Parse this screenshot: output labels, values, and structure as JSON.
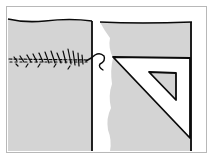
{
  "illustration": {
    "subject": "sewing seam beside a set square",
    "colors": {
      "background": "#ffffff",
      "frame": "#b8b8b8",
      "fabric": "#d4d4d4",
      "ink": "#0a0a0a",
      "tear": "#ffffff"
    },
    "elements": [
      {
        "name": "left-fabric-panel"
      },
      {
        "name": "stitched-seam"
      },
      {
        "name": "loose-thread"
      },
      {
        "name": "right-panel"
      },
      {
        "name": "set-square"
      }
    ]
  }
}
